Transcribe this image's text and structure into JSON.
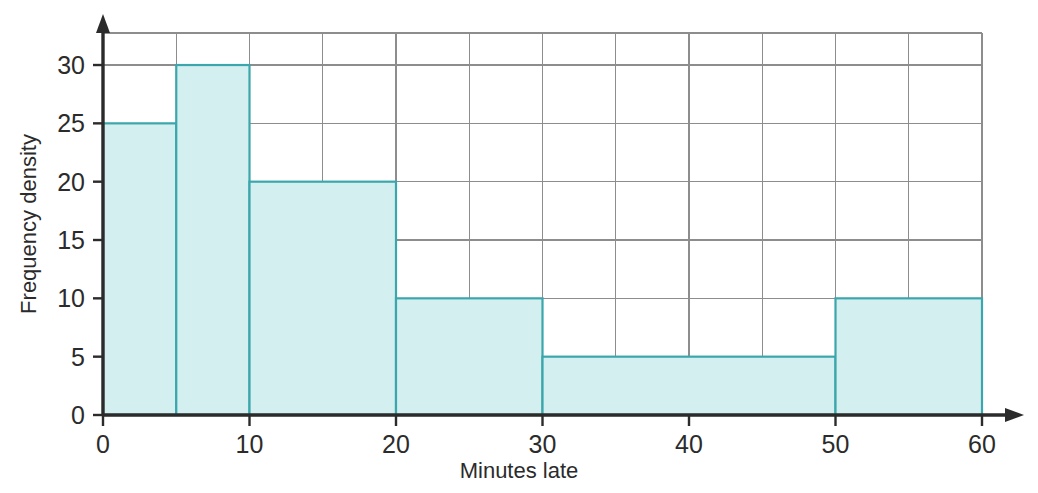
{
  "chart_data": {
    "type": "bar",
    "title": "",
    "subtitle": "",
    "xlabel": "Minutes late",
    "ylabel": "Frequency density",
    "xlim": [
      0,
      60
    ],
    "ylim": [
      0,
      33
    ],
    "grid": true,
    "legend": null,
    "x_ticks": [
      "0",
      "10",
      "20",
      "30",
      "40",
      "50",
      "60"
    ],
    "x_tick_values": [
      0,
      10,
      20,
      30,
      40,
      50,
      60
    ],
    "y_ticks": [
      "0",
      "5",
      "10",
      "15",
      "20",
      "25",
      "30"
    ],
    "y_tick_values": [
      0,
      5,
      10,
      15,
      20,
      25,
      30
    ],
    "grid_step_x": 5,
    "grid_step_y": 5,
    "bin_edges": [
      0,
      5,
      10,
      20,
      30,
      50,
      60
    ],
    "categories": [
      "0-5",
      "5-10",
      "10-20",
      "20-30",
      "30-50",
      "50-60"
    ],
    "values": [
      25,
      30,
      20,
      10,
      5,
      10
    ],
    "bars": [
      {
        "label": "0-5",
        "x0": 0,
        "x1": 5,
        "value": 25
      },
      {
        "label": "5-10",
        "x0": 5,
        "x1": 10,
        "value": 30
      },
      {
        "label": "10-20",
        "x0": 10,
        "x1": 20,
        "value": 20
      },
      {
        "label": "20-30",
        "x0": 20,
        "x1": 30,
        "value": 10
      },
      {
        "label": "30-50",
        "x0": 30,
        "x1": 50,
        "value": 5
      },
      {
        "label": "50-60",
        "x0": 50,
        "x1": 60,
        "value": 10
      }
    ]
  },
  "colors": {
    "bar_fill": "#d4eff0",
    "bar_stroke": "#3ba6ab",
    "grid": "#8d8d8d",
    "axis": "#2b2b2b",
    "text": "#2b2b2b",
    "background": "#ffffff"
  },
  "axes": {
    "x_title": "Minutes late",
    "y_title": "Frequency density"
  }
}
